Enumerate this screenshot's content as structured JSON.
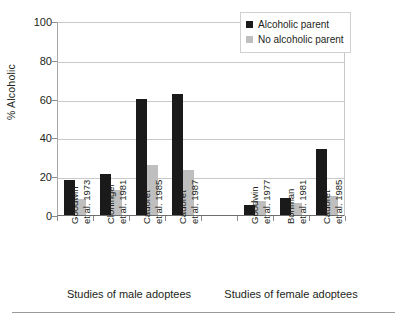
{
  "chart_data": {
    "type": "bar",
    "title": "",
    "xlabel": "",
    "ylabel": "% Alcoholic",
    "ylim": [
      0,
      100
    ],
    "yticks": [
      0,
      20,
      40,
      60,
      80,
      100
    ],
    "grid": true,
    "legend_position": "top-right",
    "categories": [
      "Goodwin et al. 1973",
      "Cloninger et al. 1981",
      "Cadoret et al. 1985",
      "Cadoret et al. 1987",
      "",
      "Goodwin et al. 1977",
      "Bohman et al. 1981",
      "Cadoret et al. 1985"
    ],
    "category_lines": [
      [
        "Goodwin",
        "et al. 1973"
      ],
      [
        "Cloninger",
        "et al. 1981"
      ],
      [
        "Cadoret",
        "et al. 1985"
      ],
      [
        "Cadoret",
        "et al. 1987"
      ],
      [
        "",
        ""
      ],
      [
        "Goodwin",
        "et al. 1977"
      ],
      [
        "Bohman",
        "et al. 1981"
      ],
      [
        "Cadoret",
        "et al. 1985"
      ]
    ],
    "series": [
      {
        "name": "Alcoholic parent",
        "color": "#1a1a1a",
        "values": [
          18,
          21,
          60,
          62.5,
          null,
          5,
          9,
          34
        ]
      },
      {
        "name": "No alcoholic parent",
        "color": "#bfbfbf",
        "values": [
          8,
          13,
          26,
          23,
          null,
          7,
          6,
          10
        ]
      }
    ],
    "groups": [
      {
        "label": "Studies of male adoptees",
        "categories": [
          0,
          1,
          2,
          3
        ]
      },
      {
        "label": "Studies of female adoptees",
        "categories": [
          5,
          6,
          7
        ]
      }
    ]
  },
  "legend": {
    "items": [
      {
        "label": "Alcoholic parent",
        "color": "#1a1a1a"
      },
      {
        "label": "No alcoholic parent",
        "color": "#bfbfbf"
      }
    ]
  },
  "axis": {
    "y_title": "% Alcoholic",
    "y_tick_labels": [
      "100",
      "80",
      "60",
      "40",
      "20",
      "0"
    ]
  },
  "group_labels": [
    "Studies of male adoptees",
    "Studies of female adoptees"
  ],
  "colors": {
    "alcoholic_parent": "#1a1a1a",
    "no_alcoholic_parent": "#bfbfbf",
    "axis": "#8c8c8c",
    "grid": "#c9c9c9",
    "text": "#231f20"
  }
}
